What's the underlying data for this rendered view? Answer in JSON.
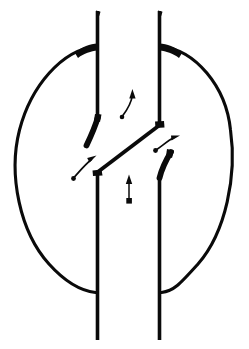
{
  "figure": {
    "style": "line-art",
    "background_color": "#ffffff",
    "ink_color": "#0a0a0a",
    "canvas": {
      "width": 249,
      "height": 349
    }
  },
  "diagram_data": {
    "type": "line-drawing",
    "elements": [
      {
        "name": "outer-circle",
        "kind": "circle",
        "cx": 124,
        "cy": 171,
        "r": 107,
        "stroke_width": 3.2,
        "note": "large circular body outline, interrupted where the vertical conduits cross it"
      },
      {
        "name": "left-conduit-upper",
        "kind": "line",
        "x1": 97.5,
        "y1": 11,
        "x2": 97.5,
        "y2": 117,
        "stroke_width": 3.6
      },
      {
        "name": "left-conduit-lower",
        "kind": "line",
        "x1": 97.5,
        "y1": 171,
        "x2": 97.5,
        "y2": 340,
        "stroke_width": 3.6
      },
      {
        "name": "right-conduit-upper",
        "kind": "line",
        "x1": 159.5,
        "y1": 11,
        "x2": 159.5,
        "y2": 125,
        "stroke_width": 3.6
      },
      {
        "name": "right-conduit-lower",
        "kind": "line",
        "x1": 159.5,
        "y1": 178,
        "x2": 159.5,
        "y2": 340,
        "stroke_width": 3.6
      },
      {
        "name": "diagonal-flapper",
        "kind": "line",
        "x1": 97.5,
        "y1": 172,
        "x2": 160,
        "y2": 124.5,
        "stroke_width": 3.6,
        "note": "inclined partition / flapper plate spanning the two conduits"
      },
      {
        "name": "upper-left-hook",
        "kind": "curve",
        "stroke_width": 5.4,
        "note": "thick curved seat hanging from left conduit, sweeping down-left"
      },
      {
        "name": "lower-right-hook",
        "kind": "curve",
        "stroke_width": 5.4,
        "note": "thick curved seat rising from right conduit, sweeping up-right"
      },
      {
        "name": "top-left-joint",
        "kind": "joint-blob",
        "note": "thickened junction where circle meets left conduit at top"
      },
      {
        "name": "top-right-joint",
        "kind": "joint-blob",
        "note": "thickened junction where circle meets right conduit at top"
      }
    ],
    "arrows": [
      {
        "name": "center-upper-curved-arrow",
        "kind": "curved",
        "direction": "up",
        "head_at": [
          132,
          91
        ],
        "tail_at": [
          123,
          117
        ],
        "note": "curved flow arrow between conduits, upper middle"
      },
      {
        "name": "center-lower-straight-arrow",
        "kind": "straight",
        "direction": "up",
        "head_at": [
          129,
          176
        ],
        "tail_at": [
          129,
          203
        ],
        "note": "straight flow arrow with square tail, lower middle"
      },
      {
        "name": "left-curved-arrow",
        "kind": "curved",
        "direction": "up-right",
        "head_at": [
          94,
          157
        ],
        "tail_at": [
          73,
          178
        ],
        "note": "curved flow arrow on the left, pointing toward the diagonal"
      },
      {
        "name": "right-curved-arrow",
        "kind": "curved",
        "direction": "up-right",
        "head_at": [
          178,
          136
        ],
        "tail_at": [
          155,
          150
        ],
        "note": "curved flow arrow on the right, pointing away from the diagonal"
      }
    ]
  }
}
